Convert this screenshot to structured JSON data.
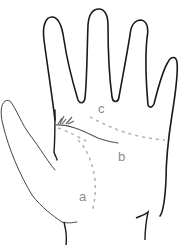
{
  "diagram": {
    "labels": {
      "a": "a",
      "b": "b",
      "c": "c"
    },
    "colors": {
      "outline": "#1a1a1a",
      "thumb_outline": "#444444",
      "solid_line": "#555555",
      "dashed_line": "#b5b5b5",
      "label": "#8a8a8a",
      "background": "#ffffff"
    }
  }
}
